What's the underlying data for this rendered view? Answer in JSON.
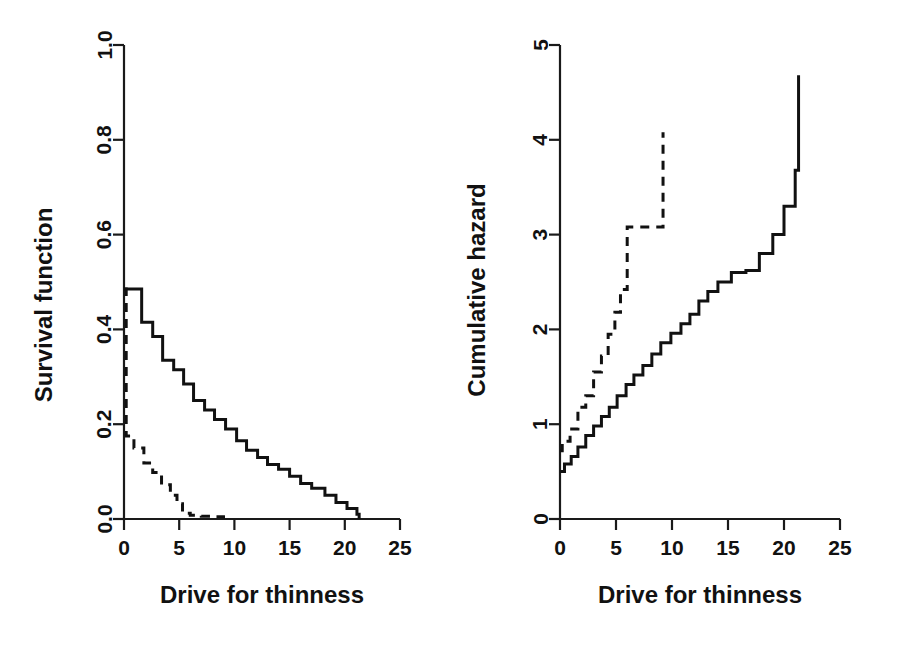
{
  "figure": {
    "background_color": "#ffffff",
    "line_color": "#111111",
    "panels": [
      "survival-function-panel",
      "cumulative-hazard-panel"
    ]
  },
  "chart_data": [
    {
      "type": "line",
      "name": "survival-function",
      "title": "",
      "xlabel": "Drive for thinness",
      "ylabel": "Survival function",
      "xlim": [
        0,
        25
      ],
      "ylim": [
        0,
        1
      ],
      "xticks": [
        0,
        5,
        10,
        15,
        20,
        25
      ],
      "xticklabels": [
        "0",
        "5",
        "10",
        "15",
        "20",
        "25"
      ],
      "yticks": [
        0.0,
        0.2,
        0.4,
        0.6,
        0.8,
        1.0
      ],
      "yticklabels": [
        "0.0",
        "0.2",
        "0.4",
        "0.6",
        "0.8",
        "1.0"
      ],
      "grid": false,
      "legend": "none",
      "step_mode": "post",
      "series": [
        {
          "name": "solid-group",
          "style": "solid",
          "x": [
            0,
            0.4,
            1.6,
            2.6,
            3.5,
            4.5,
            5.4,
            6.3,
            7.3,
            8.2,
            9.2,
            10.2,
            11.1,
            12.1,
            13.0,
            14.0,
            15.0,
            16.0,
            17.0,
            18.2,
            19.2,
            20.2,
            21.1,
            21.3
          ],
          "y": [
            0.485,
            0.485,
            0.415,
            0.385,
            0.335,
            0.315,
            0.285,
            0.25,
            0.23,
            0.21,
            0.19,
            0.165,
            0.145,
            0.13,
            0.115,
            0.105,
            0.09,
            0.075,
            0.065,
            0.05,
            0.035,
            0.022,
            0.01,
            0.0
          ]
        },
        {
          "name": "dashed-group",
          "style": "dashed",
          "x": [
            0,
            0.2,
            0.9,
            1.8,
            2.6,
            3.4,
            4.2,
            4.8,
            5.3,
            6.0,
            7.0,
            8.0,
            9.0,
            9.3
          ],
          "y": [
            0.485,
            0.175,
            0.15,
            0.118,
            0.098,
            0.072,
            0.05,
            0.032,
            0.012,
            0.008,
            0.006,
            0.005,
            0.004,
            0.004
          ]
        }
      ]
    },
    {
      "type": "line",
      "name": "cumulative-hazard",
      "title": "",
      "xlabel": "Drive for thinness",
      "ylabel": "Cumulative hazard",
      "xlim": [
        0,
        25
      ],
      "ylim": [
        0,
        5
      ],
      "xticks": [
        0,
        5,
        10,
        15,
        20,
        25
      ],
      "xticklabels": [
        "0",
        "5",
        "10",
        "15",
        "20",
        "25"
      ],
      "yticks": [
        0,
        1,
        2,
        3,
        4,
        5
      ],
      "yticklabels": [
        "0",
        "1",
        "2",
        "3",
        "4",
        "5"
      ],
      "grid": false,
      "legend": "none",
      "step_mode": "post",
      "series": [
        {
          "name": "solid-group",
          "style": "solid",
          "x": [
            0,
            0.4,
            1.0,
            1.6,
            2.3,
            3.0,
            3.7,
            4.4,
            5.1,
            5.9,
            6.6,
            7.4,
            8.2,
            9.0,
            9.9,
            10.8,
            11.6,
            12.4,
            13.2,
            14.1,
            15.3,
            16.6,
            17.8,
            19.0,
            20.0,
            21.0,
            21.3
          ],
          "y": [
            0.5,
            0.58,
            0.66,
            0.76,
            0.88,
            0.98,
            1.08,
            1.18,
            1.3,
            1.42,
            1.52,
            1.62,
            1.74,
            1.86,
            1.96,
            2.06,
            2.16,
            2.3,
            2.4,
            2.5,
            2.6,
            2.62,
            2.8,
            3.0,
            3.3,
            3.68,
            4.68
          ]
        },
        {
          "name": "dashed-group",
          "style": "dashed",
          "x": [
            0,
            0.2,
            0.9,
            1.6,
            2.3,
            3.0,
            3.7,
            4.3,
            4.9,
            5.4,
            6.0,
            9.0,
            9.2
          ],
          "y": [
            0.72,
            0.82,
            0.95,
            1.18,
            1.3,
            1.55,
            1.72,
            1.95,
            2.18,
            2.42,
            3.08,
            3.08,
            4.08
          ]
        }
      ]
    }
  ]
}
